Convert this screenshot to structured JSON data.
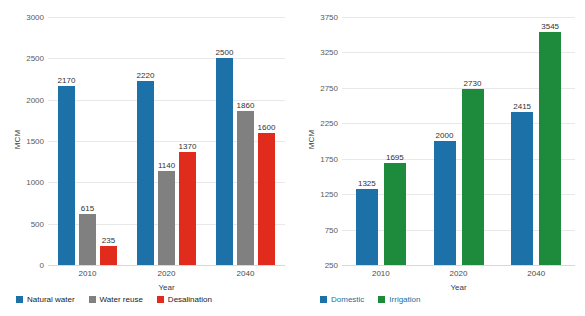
{
  "chart_data": [
    {
      "panel": "left",
      "type": "bar",
      "title": "",
      "xlabel": "Year",
      "ylabel": "MCM",
      "categories": [
        "2010",
        "2020",
        "2040"
      ],
      "ylim": [
        0,
        3000
      ],
      "yticks": [
        3000,
        2500,
        2000,
        1500,
        1000,
        500,
        0
      ],
      "ytick_labels": [
        "3000",
        "2500",
        "2000",
        "1500",
        "1000",
        "500",
        "0"
      ],
      "grid": true,
      "legend_position": "bottom-left",
      "series": [
        {
          "name": "Natural water",
          "color": "#1c72a8",
          "values": [
            2170,
            2220,
            2500
          ],
          "labels": [
            "2170",
            "2220",
            "2500"
          ]
        },
        {
          "name": "Water reuse",
          "color": "#808080",
          "values": [
            615,
            1140,
            1860
          ],
          "labels": [
            "615",
            "1140",
            "1860"
          ]
        },
        {
          "name": "Desalination",
          "color": "#e02b1d",
          "values": [
            235,
            1370,
            1600
          ],
          "labels": [
            "235",
            "1370",
            "1600"
          ]
        }
      ]
    },
    {
      "panel": "right",
      "type": "bar",
      "title": "",
      "xlabel": "Year",
      "ylabel": "MCM",
      "categories": [
        "2010",
        "2020",
        "2040"
      ],
      "ylim": [
        250,
        3750
      ],
      "yticks": [
        3750,
        3250,
        2750,
        2250,
        1750,
        1250,
        750,
        250
      ],
      "ytick_labels": [
        "3750",
        "3250",
        "2750",
        "2250",
        "1750",
        "1250",
        "750",
        "250"
      ],
      "grid": true,
      "legend_position": "bottom-left",
      "series": [
        {
          "name": "Domestic",
          "color": "#1c72a8",
          "values": [
            1325,
            2000,
            2415
          ],
          "labels": [
            "1325",
            "2000",
            "2415"
          ]
        },
        {
          "name": "Irrigation",
          "color": "#1e8a3c",
          "values": [
            1695,
            2730,
            3545
          ],
          "labels": [
            "1695",
            "2730",
            "3545"
          ]
        }
      ]
    }
  ],
  "left_chart": {
    "ylabel": "MCM",
    "xlabel": "Year",
    "ytick_labels": [
      "3000",
      "2500",
      "2000",
      "1500",
      "1000",
      "500",
      "0"
    ],
    "xtick_labels": [
      "2010",
      "2020",
      "2040"
    ],
    "legend": [
      {
        "label": "Natural water",
        "color": "#1c72a8"
      },
      {
        "label": "Water reuse",
        "color": "#808080"
      },
      {
        "label": "Desalination",
        "color": "#e02b1d"
      }
    ],
    "bar_labels": {
      "natural_water": [
        "2170",
        "2220",
        "2500"
      ],
      "water_reuse": [
        "615",
        "1140",
        "1860"
      ],
      "desalination": [
        "235",
        "1370",
        "1600"
      ]
    }
  },
  "right_chart": {
    "ylabel": "MCM",
    "xlabel": "Year",
    "ytick_labels": [
      "3750",
      "3250",
      "2750",
      "2250",
      "1750",
      "1250",
      "750",
      "250"
    ],
    "xtick_labels": [
      "2010",
      "2020",
      "2040"
    ],
    "legend": [
      {
        "label": "Domestic",
        "color": "#1c72a8"
      },
      {
        "label": "Irrigation",
        "color": "#1e8a3c"
      }
    ],
    "bar_labels": {
      "domestic": [
        "1325",
        "2000",
        "2415"
      ],
      "irrigation": [
        "1695",
        "2730",
        "3545"
      ]
    }
  }
}
